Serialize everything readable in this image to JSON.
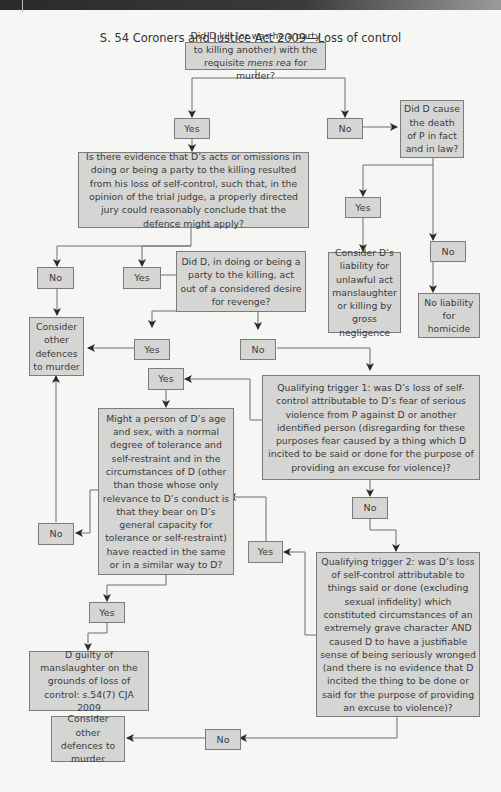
{
  "header": {
    "running_title": ""
  },
  "diagram": {
    "title": "S. 54 Coroners and Justice Act 2009—Loss of control",
    "nodes": {
      "q_kill_pre": "Did D kill (or was he a party to killing another) with the requisite ",
      "q_kill_em": "mens rea",
      "q_kill_post": " for murder?",
      "yes1": "Yes",
      "no1": "No",
      "q_cause": "Did D cause the death of P in fact and in law?",
      "q_evidence": "Is there evidence that D’s acts or omissions in doing or being a party to the killing resulted from his loss of self-control, such that, in the opinion of the trial judge, a properly directed jury could reasonably conclude that the defence might apply?",
      "yes_cause": "Yes",
      "no_cause": "No",
      "consider_liability": "Consider D’s liability for unlawful act manslaughter or killing by gross negligence",
      "no_liability": "No liability for homicide",
      "no_evidence": "No",
      "yes_evidence": "Yes",
      "q_revenge": "Did D, in doing or being a party to the killing, act out of a considered desire for revenge?",
      "consider_other_1": "Consider other defences to murder",
      "yes_revenge": "Yes",
      "no_revenge": "No",
      "yes_trigger": "Yes",
      "trigger1": "Qualifying trigger 1: was D’s loss of self-control attributable to D’s fear of serious violence from P against D or another identified person (disregarding for these purposes fear caused by a thing which D incited to be said or done for the purpose of providing an excuse for violence)?",
      "q_person": "Might a person of D’s age and sex, with a normal degree of tolerance and self-restraint and in the circumstances of D (other than those whose only relevance to D’s conduct is that they bear on D’s general capacity for tolerance or self-restraint)  have reacted in the same or in a similar way to D?",
      "no_person": "No",
      "no_trigger1": "No",
      "yes_trigger2": "Yes",
      "trigger2": "Qualifying trigger 2: was D’s loss of self-control attributable to things said or done (excluding sexual infidelity) which constituted circumstances of an extremely grave character AND caused D to have a justifiable sense of being seriously wronged (and there is no evidence that D incited the thing to be done or said for the purpose of providing an excuse to violence)?",
      "yes_person": "Yes",
      "guilty": "D guilty of manslaughter on the grounds of loss of control: s.54(7) CJA 2009",
      "consider_other_2": "Consider other defences to murder",
      "no_trigger2": "No"
    }
  },
  "colors": {
    "box_fill": "#d5d5d4",
    "box_border": "#7c7c7c",
    "line": "#6e6e6e",
    "arrow": "#2b2b2b"
  }
}
